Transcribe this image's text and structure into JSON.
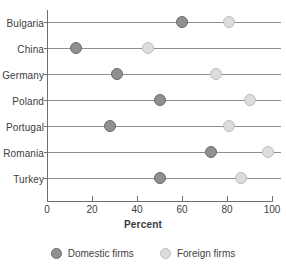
{
  "chart_data": {
    "type": "scatter",
    "subtype": "dumbbell",
    "title": "",
    "xlabel": "Percent",
    "ylabel": "",
    "xlim": [
      0,
      100
    ],
    "xticks": [
      0,
      20,
      40,
      60,
      80,
      100
    ],
    "grid": false,
    "legend_position": "bottom",
    "categories": [
      "Bulgaria",
      "China",
      "Germany",
      "Poland",
      "Portugal",
      "Romania",
      "Turkey"
    ],
    "series": [
      {
        "name": "Domestic firms",
        "color": "#909090",
        "values": [
          60,
          13,
          31,
          50,
          28,
          73,
          50
        ]
      },
      {
        "name": "Foreign firms",
        "color": "#dcdcdc",
        "values": [
          81,
          45,
          75,
          90,
          81,
          98,
          86
        ]
      }
    ]
  },
  "axis": {
    "x_title": "Percent",
    "tick_labels": [
      "0",
      "20",
      "40",
      "60",
      "80",
      "100"
    ]
  },
  "legend": {
    "items": [
      {
        "label": "Domestic firms",
        "color": "#909090"
      },
      {
        "label": "Foreign firms",
        "color": "#dcdcdc"
      }
    ]
  },
  "title_fragment": ""
}
